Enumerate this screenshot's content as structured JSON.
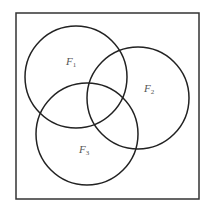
{
  "diagram": {
    "type": "venn",
    "stroke_color": "#222222",
    "frame": {
      "x": 16,
      "y": 13,
      "width": 183,
      "height": 186
    },
    "sets": [
      {
        "name": "F1",
        "base": "F",
        "sub": "1",
        "cx": 76,
        "cy": 77,
        "r": 51,
        "label_x": 66,
        "label_y": 65
      },
      {
        "name": "F2",
        "base": "F",
        "sub": "2",
        "cx": 138,
        "cy": 98,
        "r": 51,
        "label_x": 144,
        "label_y": 92
      },
      {
        "name": "F3",
        "base": "F",
        "sub": "3",
        "cx": 87,
        "cy": 134,
        "r": 51,
        "label_x": 79,
        "label_y": 153
      }
    ]
  }
}
